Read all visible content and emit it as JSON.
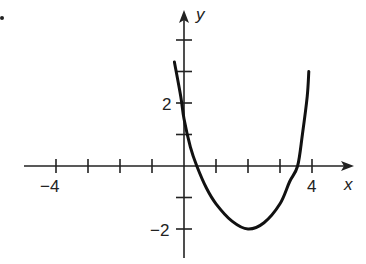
{
  "chart_data": {
    "type": "line",
    "title": "",
    "xlabel": "x",
    "ylabel": "y",
    "xlim": [
      -5,
      5
    ],
    "ylim": [
      -3,
      4
    ],
    "grid": false,
    "x_tick_values": [
      -4,
      -3,
      -2,
      -1,
      1,
      2,
      3,
      4
    ],
    "y_tick_values": [
      -2,
      -1,
      1,
      2,
      3,
      4
    ],
    "x_tick_labels": [
      {
        "value": -4,
        "text": "−4"
      },
      {
        "value": 4,
        "text": "4"
      }
    ],
    "y_tick_labels": [
      {
        "value": 2,
        "text": "2"
      },
      {
        "value": -2,
        "text": "−2"
      }
    ],
    "series": [
      {
        "name": "curve",
        "x": [
          -0.3,
          -0.1,
          0,
          0.2,
          0.4,
          0.7,
          1,
          1.5,
          2,
          2.5,
          3,
          3.3,
          3.55,
          3.7,
          3.85,
          3.9
        ],
        "y": [
          3.3,
          2.2,
          1.5,
          0.6,
          0,
          -0.7,
          -1.2,
          -1.75,
          -2,
          -1.8,
          -1.2,
          -0.5,
          0,
          1,
          2.2,
          3.0
        ]
      }
    ],
    "annotations": [
      {
        "text": "minimum",
        "x": 2,
        "y": -2
      }
    ]
  },
  "labels": {
    "x_axis": "x",
    "y_axis": "y",
    "x_neg4": "−4",
    "x_4": "4",
    "y_2": "2",
    "y_neg2": "−2"
  }
}
